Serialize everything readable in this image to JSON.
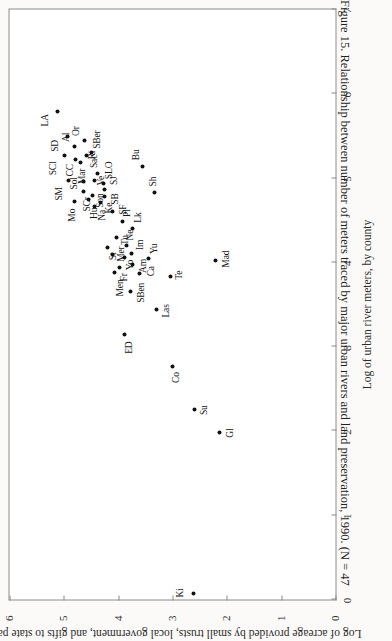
{
  "figure": {
    "caption": "Figure 15. Relationship between number of meters traced by major urban rivers and land preservation, 1990. (N = 47"
  },
  "chart_data": {
    "type": "scatter",
    "title": "",
    "xlabel": "Log of urban river meters, by county",
    "ylabel": "Log of acreage provided by small trusts, local government, and gifts to state parks",
    "xlim": [
      0,
      7
    ],
    "ylim": [
      0,
      6
    ],
    "xticks": [
      0,
      1,
      2,
      3,
      4,
      5,
      6,
      7
    ],
    "yticks": [
      0,
      1,
      2,
      3,
      4,
      5,
      6
    ],
    "grid": false,
    "legend": "none",
    "n": 47,
    "point_label_field": "county abbreviation",
    "points": [
      {
        "label": "LA",
        "x": 5.79,
        "y": 5.12,
        "lx": -15,
        "ly": -12
      },
      {
        "label": "SD",
        "x": 5.49,
        "y": 4.93,
        "lx": -15,
        "ly": -12
      },
      {
        "label": "SCl",
        "x": 5.27,
        "y": 4.99,
        "lx": -20,
        "ly": -11
      },
      {
        "label": "Al",
        "x": 5.38,
        "y": 4.8,
        "lx": 4,
        "ly": -8
      },
      {
        "label": "Or",
        "x": 5.44,
        "y": 4.62,
        "lx": 5,
        "ly": -8
      },
      {
        "label": "CC",
        "x": 5.22,
        "y": 4.78,
        "lx": -17,
        "ly": -5
      },
      {
        "label": "Mar",
        "x": 5.19,
        "y": 4.7,
        "lx": -22,
        "ly": 2
      },
      {
        "label": "Ri",
        "x": 5.27,
        "y": 4.59,
        "lx": -4,
        "ly": 6
      },
      {
        "label": "SBer",
        "x": 5.3,
        "y": 4.5,
        "lx": 4,
        "ly": 6
      },
      {
        "label": "SM",
        "x": 4.97,
        "y": 4.91,
        "lx": -20,
        "ly": -9
      },
      {
        "label": "Mo",
        "x": 4.72,
        "y": 4.8,
        "lx": -20,
        "ly": -2
      },
      {
        "label": "SCr",
        "x": 4.84,
        "y": 4.64,
        "lx": -20,
        "ly": 4
      },
      {
        "label": "Hu",
        "x": 4.74,
        "y": 4.55,
        "lx": -19,
        "ly": 6
      },
      {
        "label": "Sol",
        "x": 4.96,
        "y": 4.63,
        "lx": -8,
        "ly": -9
      },
      {
        "label": "Sac",
        "x": 5.06,
        "y": 4.38,
        "lx": 5,
        "ly": -3
      },
      {
        "label": "Ve",
        "x": 4.97,
        "y": 4.43,
        "lx": -5,
        "ly": 7
      },
      {
        "label": "Son",
        "x": 4.79,
        "y": 4.47,
        "lx": -12,
        "ly": 8
      },
      {
        "label": "Na",
        "x": 4.66,
        "y": 4.44,
        "lx": -14,
        "ly": 8
      },
      {
        "label": "SLO",
        "x": 4.94,
        "y": 4.27,
        "lx": 4,
        "ly": 6
      },
      {
        "label": "SJ",
        "x": 4.87,
        "y": 4.25,
        "lx": 4,
        "ly": 10
      },
      {
        "label": "SB",
        "x": 4.78,
        "y": 4.25,
        "lx": -8,
        "ly": 11
      },
      {
        "label": "Ke",
        "x": 4.71,
        "y": 4.33,
        "lx": -11,
        "ly": 9
      },
      {
        "label": "Bu",
        "x": 5.14,
        "y": 3.55,
        "lx": 6,
        "ly": -6
      },
      {
        "label": "Sh",
        "x": 4.83,
        "y": 3.33,
        "lx": 6,
        "ly": -1
      },
      {
        "label": "SF",
        "x": 4.6,
        "y": 4.1,
        "lx": -3,
        "ly": 11
      },
      {
        "label": "Pl",
        "x": 4.48,
        "y": 3.92,
        "lx": 5,
        "ly": 5
      },
      {
        "label": "Lk",
        "x": 4.4,
        "y": 3.73,
        "lx": 6,
        "ly": 6
      },
      {
        "label": "Tu",
        "x": 4.3,
        "y": 4.03,
        "lx": -8,
        "ly": 9
      },
      {
        "label": "St",
        "x": 4.18,
        "y": 4.19,
        "lx": -13,
        "ly": 6
      },
      {
        "label": "Mer",
        "x": 4.09,
        "y": 4.1,
        "lx": -7,
        "ly": 9
      },
      {
        "label": "Fr",
        "x": 3.94,
        "y": 3.97,
        "lx": -14,
        "ly": 5
      },
      {
        "label": "Yo",
        "x": 4.06,
        "y": 3.88,
        "lx": -13,
        "ly": 6
      },
      {
        "label": "Ne",
        "x": 4.2,
        "y": 3.84,
        "lx": 5,
        "ly": 4
      },
      {
        "label": "Im",
        "x": 4.1,
        "y": 3.76,
        "lx": 4,
        "ly": 9
      },
      {
        "label": "Am",
        "x": 3.97,
        "y": 3.73,
        "lx": -8,
        "ly": 11
      },
      {
        "label": "Men",
        "x": 3.88,
        "y": 4.06,
        "lx": -24,
        "ly": 6
      },
      {
        "label": "Yu",
        "x": 4.04,
        "y": 3.44,
        "lx": 5,
        "ly": 6
      },
      {
        "label": "Ca",
        "x": 3.87,
        "y": 3.6,
        "lx": -3,
        "ly": 12
      },
      {
        "label": "SBen",
        "x": 3.65,
        "y": 3.77,
        "lx": -11,
        "ly": 11
      },
      {
        "label": "Te",
        "x": 3.83,
        "y": 3.04,
        "lx": -3,
        "ly": 9
      },
      {
        "label": "Las",
        "x": 3.44,
        "y": 3.29,
        "lx": -8,
        "ly": 10
      },
      {
        "label": "ED",
        "x": 3.14,
        "y": 3.88,
        "lx": -19,
        "ly": 5
      },
      {
        "label": "Mad",
        "x": 4.02,
        "y": 2.2,
        "lx": -7,
        "ly": 11
      },
      {
        "label": "Co",
        "x": 2.76,
        "y": 3.0,
        "lx": -16,
        "ly": 4
      },
      {
        "label": "Su",
        "x": 2.26,
        "y": 2.6,
        "lx": -6,
        "ly": 10
      },
      {
        "label": "Gl",
        "x": 1.98,
        "y": 2.14,
        "lx": -5,
        "ly": 11
      },
      {
        "label": "Ki",
        "x": 0.07,
        "y": 2.62,
        "lx": -4,
        "ly": -13
      }
    ]
  }
}
